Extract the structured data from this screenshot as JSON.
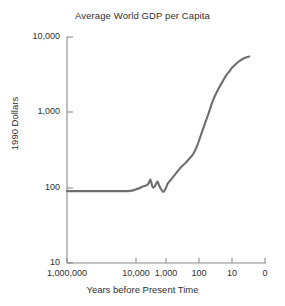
{
  "chart_data": {
    "type": "line",
    "title": "Average World GDP per Capita",
    "xlabel": "Years before Present Time",
    "ylabel": "1990 Dollars",
    "xscale": "log-reversed",
    "yscale": "log",
    "xlim": [
      1000000,
      1
    ],
    "ylim": [
      10,
      10000
    ],
    "grid": false,
    "legend": "none",
    "line_color": "#6e6e6e",
    "text_color": "#2f2f2f",
    "axis_color": "#8a8a8a",
    "background": "#ffffff",
    "xticks": [
      {
        "label": "1,000,000",
        "value": 1000000,
        "px": 67
      },
      {
        "label": "10,000",
        "value": 10000,
        "px": 136
      },
      {
        "label": "1,000",
        "value": 1000,
        "px": 166
      },
      {
        "label": "100",
        "value": 100,
        "px": 199
      },
      {
        "label": "10",
        "value": 10,
        "px": 232
      },
      {
        "label": "0",
        "value": 1,
        "px": 265
      }
    ],
    "yticks": [
      {
        "label": "10,000",
        "value": 10000,
        "px": 37
      },
      {
        "label": "1,000",
        "value": 1000,
        "px": 112
      },
      {
        "label": "100",
        "value": 100,
        "px": 188
      },
      {
        "label": "10",
        "value": 10,
        "px": 263
      }
    ],
    "series": [
      {
        "name": "Average World GDP per Capita",
        "x_years_before_present": [
          1000000,
          300000,
          100000,
          30000,
          20000,
          15000,
          12000,
          10000,
          8000,
          6000,
          5000,
          4000,
          3500,
          3200,
          3000,
          2800,
          2600,
          2400,
          2200,
          2000,
          1800,
          1600,
          1400,
          1200,
          1000,
          900,
          800,
          700,
          600,
          500,
          400,
          300,
          250,
          200,
          150,
          120,
          100,
          80,
          60,
          50,
          40,
          30,
          25,
          20,
          15,
          12,
          10,
          8,
          6,
          4,
          3
        ],
        "y_1990_dollars": [
          90,
          90,
          90,
          90,
          90,
          90,
          91,
          92,
          95,
          100,
          104,
          107,
          112,
          120,
          128,
          118,
          104,
          100,
          104,
          112,
          120,
          106,
          95,
          88,
          100,
          112,
          120,
          128,
          140,
          155,
          175,
          200,
          215,
          240,
          280,
          340,
          420,
          560,
          800,
          1000,
          1350,
          1800,
          2100,
          2500,
          3100,
          3500,
          3900,
          4300,
          4800,
          5300,
          5500
        ]
      }
    ],
    "annotations": []
  },
  "chart": {
    "title": "Average World GDP per Capita",
    "x_axis_title": "Years before Present Time",
    "y_axis_title": "1990 Dollars",
    "y_tick_labels": [
      "10,000",
      "1,000",
      "100",
      "10"
    ],
    "x_tick_labels": [
      "1,000,000",
      "10,000",
      "1,000",
      "100",
      "10",
      "0"
    ]
  }
}
